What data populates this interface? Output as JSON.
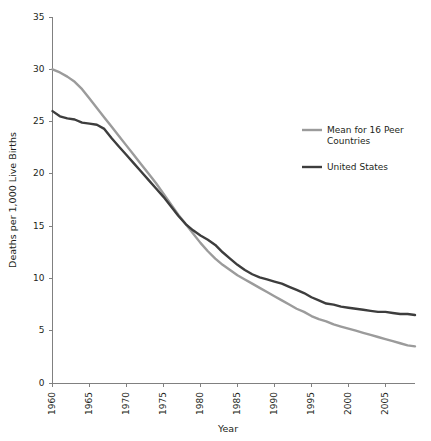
{
  "chart_data": {
    "type": "line",
    "title": "",
    "xlabel": "Year",
    "ylabel": "Deaths per 1,000 Live Births",
    "xlim": [
      1960,
      2009
    ],
    "ylim": [
      0,
      35
    ],
    "xticks": [
      1960,
      1965,
      1970,
      1975,
      1980,
      1985,
      1990,
      1995,
      2000,
      2005
    ],
    "xtick_labels": [
      "1960",
      "1965",
      "1970",
      "1975",
      "1980",
      "1985",
      "1990",
      "1995",
      "2000",
      "2005"
    ],
    "yticks": [
      0,
      5,
      10,
      15,
      20,
      25,
      30,
      35
    ],
    "ytick_labels": [
      "0",
      "5",
      "10",
      "15",
      "20",
      "25",
      "30",
      "35"
    ],
    "grid": false,
    "legend_position": "right-upper",
    "x": [
      1960,
      1961,
      1962,
      1963,
      1964,
      1965,
      1966,
      1967,
      1968,
      1969,
      1970,
      1971,
      1972,
      1973,
      1974,
      1975,
      1976,
      1977,
      1978,
      1979,
      1980,
      1981,
      1982,
      1983,
      1984,
      1985,
      1986,
      1987,
      1988,
      1989,
      1990,
      1991,
      1992,
      1993,
      1994,
      1995,
      1996,
      1997,
      1998,
      1999,
      2000,
      2001,
      2002,
      2003,
      2004,
      2005,
      2006,
      2007,
      2008,
      2009
    ],
    "series": [
      {
        "name": "Mean for 16 Peer Countries",
        "color": "#9b9b9b",
        "values": [
          30.0,
          29.7,
          29.3,
          28.8,
          28.1,
          27.2,
          26.3,
          25.4,
          24.5,
          23.6,
          22.7,
          21.8,
          20.9,
          20.0,
          19.1,
          18.1,
          17.1,
          16.1,
          15.2,
          14.3,
          13.4,
          12.6,
          11.9,
          11.3,
          10.8,
          10.3,
          9.9,
          9.5,
          9.1,
          8.7,
          8.3,
          7.9,
          7.5,
          7.1,
          6.8,
          6.4,
          6.1,
          5.9,
          5.6,
          5.4,
          5.2,
          5.0,
          4.8,
          4.6,
          4.4,
          4.2,
          4.0,
          3.8,
          3.6,
          3.5
        ]
      },
      {
        "name": "United States",
        "color": "#3d3d3d",
        "values": [
          26.0,
          25.5,
          25.3,
          25.2,
          24.9,
          24.8,
          24.7,
          24.3,
          23.4,
          22.6,
          21.8,
          21.0,
          20.2,
          19.4,
          18.6,
          17.8,
          16.9,
          16.0,
          15.2,
          14.6,
          14.1,
          13.7,
          13.2,
          12.5,
          11.9,
          11.3,
          10.8,
          10.4,
          10.1,
          9.9,
          9.7,
          9.5,
          9.2,
          8.9,
          8.6,
          8.2,
          7.9,
          7.6,
          7.5,
          7.3,
          7.2,
          7.1,
          7.0,
          6.9,
          6.8,
          6.8,
          6.7,
          6.6,
          6.6,
          6.5
        ]
      }
    ]
  },
  "legend": {
    "items": [
      {
        "label_line1": "Mean for 16 Peer",
        "label_line2": "Countries",
        "color": "#9b9b9b"
      },
      {
        "label_line1": "United States",
        "label_line2": "",
        "color": "#3d3d3d"
      }
    ]
  },
  "axes": {
    "x_title": "Year",
    "y_title": "Deaths per 1,000 Live Births"
  }
}
